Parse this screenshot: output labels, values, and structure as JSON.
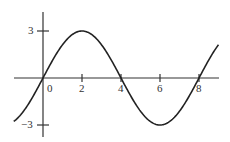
{
  "chart_data": {
    "type": "line",
    "title": "",
    "xlabel": "",
    "ylabel": "",
    "function": "y = 3 sin(pi x / 4)",
    "x_ticks": [
      "0",
      "2",
      "4",
      "6",
      "8"
    ],
    "y_ticks": [
      "3",
      "-3"
    ],
    "xlim": [
      -1.5,
      9
    ],
    "ylim": [
      -3.5,
      3.5
    ],
    "grid": false,
    "series": [
      {
        "name": "sine",
        "x": [
          -1.5,
          -1,
          0,
          1,
          2,
          3,
          4,
          5,
          6,
          7,
          8,
          9
        ],
        "y": [
          -2.77,
          -2.12,
          0,
          2.12,
          3,
          2.12,
          0,
          -2.12,
          -3,
          -2.12,
          0,
          2.12
        ]
      }
    ]
  },
  "labels": {
    "x0": "0",
    "x2": "2",
    "x4": "4",
    "x6": "6",
    "x8": "8",
    "y3": "3",
    "yneg3": "−3"
  }
}
